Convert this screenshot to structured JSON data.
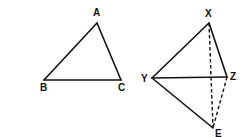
{
  "figures": [
    {
      "name": "triangle-abc",
      "vertices": [
        {
          "id": "A",
          "label": "A",
          "x": 97,
          "y": 23,
          "lx": 93,
          "ly": 16
        },
        {
          "id": "B",
          "label": "B",
          "x": 44,
          "y": 80,
          "lx": 40,
          "ly": 91
        },
        {
          "id": "C",
          "label": "C",
          "x": 121,
          "y": 80,
          "lx": 118,
          "ly": 91
        }
      ],
      "edges": [
        {
          "from": "A",
          "to": "B",
          "style": "solid"
        },
        {
          "from": "B",
          "to": "C",
          "style": "solid"
        },
        {
          "from": "C",
          "to": "A",
          "style": "solid"
        }
      ]
    },
    {
      "name": "figure-xyze",
      "vertices": [
        {
          "id": "X",
          "label": "X",
          "x": 209,
          "y": 23,
          "lx": 205,
          "ly": 17
        },
        {
          "id": "Y",
          "label": "Y",
          "x": 152,
          "y": 78,
          "lx": 141,
          "ly": 82
        },
        {
          "id": "Z",
          "label": "Z",
          "x": 227,
          "y": 77,
          "lx": 230,
          "ly": 80
        },
        {
          "id": "E",
          "label": "E",
          "x": 213,
          "y": 128,
          "lx": 215,
          "ly": 137
        }
      ],
      "edges": [
        {
          "from": "X",
          "to": "Y",
          "style": "solid"
        },
        {
          "from": "X",
          "to": "Z",
          "style": "solid"
        },
        {
          "from": "Y",
          "to": "Z",
          "style": "solid"
        },
        {
          "from": "Y",
          "to": "E",
          "style": "solid"
        },
        {
          "from": "X",
          "to": "E",
          "style": "dashed"
        },
        {
          "from": "Z",
          "to": "E",
          "style": "dashed"
        }
      ]
    }
  ],
  "colors": {
    "stroke": "#111111",
    "background": "#ffffff"
  }
}
